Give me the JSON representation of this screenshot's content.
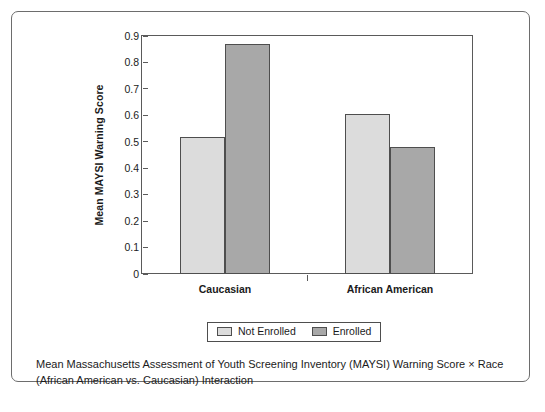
{
  "chart_data": {
    "type": "bar",
    "title": "",
    "xlabel": "",
    "ylabel": "Mean MAYSI Warning Score",
    "categories": [
      "Caucasian",
      "African American"
    ],
    "series": [
      {
        "name": "Not Enrolled",
        "values": [
          0.52,
          0.605
        ],
        "color": "#dcdcdc"
      },
      {
        "name": "Enrolled",
        "values": [
          0.87,
          0.48
        ],
        "color": "#a8a8a8"
      }
    ],
    "ylim": [
      0,
      0.9
    ],
    "ytick_labels": [
      "0.9",
      "0.8",
      "0.7",
      "0.6",
      "0.5",
      "0.4",
      "0.3",
      "0.2",
      "0.1",
      "0"
    ],
    "ytick_values": [
      0.9,
      0.8,
      0.7,
      0.6,
      0.5,
      0.4,
      0.3,
      0.2,
      0.1,
      0
    ],
    "grid": false,
    "legend_position": "bottom"
  },
  "legend": {
    "entries": [
      {
        "label": "Not Enrolled"
      },
      {
        "label": "Enrolled"
      }
    ]
  },
  "caption": {
    "line1": "Mean Massachusetts Assessment of Youth Screening Inventory (MAYSI) Warning Score × Race",
    "line2": "(African American vs. Caucasian) Interaction"
  }
}
